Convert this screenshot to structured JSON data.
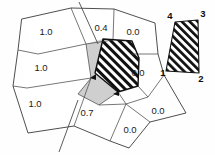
{
  "figure": {
    "background_color": "#ffffff",
    "line_color": "#3a3a3a",
    "hatch_color": "#111111",
    "gray_fill_color": "#cfcfcf"
  },
  "mesh": {
    "cells": [
      {
        "id": "cell-top-left",
        "value": "1.0",
        "label_x": 46,
        "label_y": 32,
        "fill": "white"
      },
      {
        "id": "cell-middle-left",
        "value": "1.0",
        "label_x": 41,
        "label_y": 68,
        "fill": "white"
      },
      {
        "id": "cell-bottom-left",
        "value": "1.0",
        "label_x": 35,
        "label_y": 104,
        "fill": "white"
      },
      {
        "id": "cell-top-mid",
        "value": "0.4",
        "label_x": 101,
        "label_y": 28,
        "fill": "white"
      },
      {
        "id": "cell-top-right",
        "value": "0.0",
        "label_x": 133,
        "label_y": 32,
        "fill": "white"
      },
      {
        "id": "cell-right-mid",
        "value": "0.0",
        "label_x": 138,
        "label_y": 73,
        "fill": "white"
      },
      {
        "id": "cell-bottom-mid",
        "value": "0.7",
        "label_x": 87,
        "label_y": 113,
        "fill": "white"
      },
      {
        "id": "cell-bottom-diamond",
        "value": "0.0",
        "label_x": 130,
        "label_y": 130,
        "fill": "white"
      },
      {
        "id": "cell-bottom-right",
        "value": "0.0",
        "label_x": 158,
        "label_y": 111,
        "fill": "white"
      },
      {
        "id": "cell-gray-highlight",
        "value": "",
        "label_x": 0,
        "label_y": 0,
        "fill": "gray"
      },
      {
        "id": "cell-hatched",
        "value": "",
        "label_x": 0,
        "label_y": 0,
        "fill": "hatch"
      }
    ]
  },
  "inset": {
    "id": "hatched-quadrilateral-inset",
    "vertex_labels": [
      {
        "name": "4",
        "x": 170,
        "y": 16
      },
      {
        "name": "3",
        "x": 203,
        "y": 14
      },
      {
        "name": "2",
        "x": 201,
        "y": 79
      },
      {
        "name": "1",
        "x": 163,
        "y": 73
      }
    ]
  }
}
